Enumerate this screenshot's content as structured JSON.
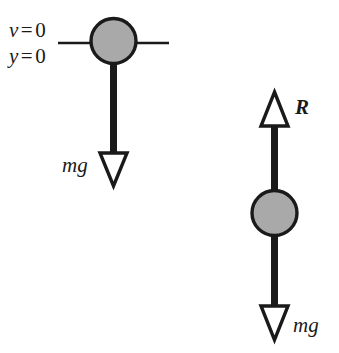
{
  "figure": {
    "width": 339,
    "height": 353,
    "background_color": "#ffffff",
    "ink_color": "#1a1a1a",
    "ball_fill_color": "#a9a9a9",
    "arrowhead_fill_color": "#ffffff"
  },
  "left_diagram": {
    "name": "ball-at-initial-position",
    "annotations": {
      "velocity": {
        "variable": "v",
        "relation": "=",
        "value": "0"
      },
      "position": {
        "variable": "y",
        "relation": "=",
        "value": "0"
      }
    },
    "ground_line": {
      "label": "reference-line"
    },
    "ball": {
      "label": "ball"
    },
    "force_arrow": {
      "label": "mg",
      "direction": "down",
      "meaning": "weight"
    }
  },
  "right_diagram": {
    "name": "ball-with-normal-and-weight",
    "ball": {
      "label": "ball"
    },
    "up_arrow": {
      "label": "R",
      "direction": "up",
      "meaning": "reaction-force"
    },
    "down_arrow": {
      "label": "mg",
      "direction": "down",
      "meaning": "weight"
    }
  }
}
